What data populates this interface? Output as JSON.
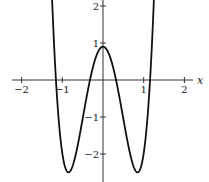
{
  "chart_data": {
    "type": "line",
    "title": "",
    "xlabel": "x",
    "ylabel": "",
    "xlim": [
      -2.3,
      2.3
    ],
    "ylim": [
      -2.75,
      2.2
    ],
    "grid": false,
    "legend": null,
    "x_ticks": [
      -2,
      -1,
      1,
      2
    ],
    "x_tick_labels": [
      "−2",
      "−1",
      "1",
      "2"
    ],
    "y_ticks": [
      2,
      1,
      -1,
      -2
    ],
    "y_tick_labels": [
      "2",
      "1",
      "−1",
      "−2"
    ],
    "series": [
      {
        "name": "f(x)",
        "formula": "6.56x^4 - 9.44x^2 + 0.9",
        "x": [
          -1.26,
          -1.2,
          -1.15,
          -1.1,
          -1.0,
          -0.85,
          -0.7,
          -0.5,
          -0.32,
          -0.2,
          0,
          0.2,
          0.32,
          0.5,
          0.7,
          0.85,
          1.0,
          1.1,
          1.15,
          1.2,
          1.26
        ],
        "y": [
          2.2,
          1.2,
          0.0,
          -0.9,
          -1.98,
          -2.5,
          -2.1,
          -1.05,
          0.0,
          0.53,
          0.9,
          0.53,
          0.0,
          -1.05,
          -2.1,
          -2.5,
          -1.98,
          -0.9,
          0.0,
          1.2,
          2.2
        ]
      }
    ],
    "annotations": [
      {
        "type": "local_max",
        "x": 0,
        "y": 0.9
      },
      {
        "type": "local_min",
        "x": -0.85,
        "y": -2.5
      },
      {
        "type": "local_min",
        "x": 0.85,
        "y": -2.5
      }
    ]
  },
  "plot": {
    "coeffs": {
      "a": 6.56,
      "b": -9.44,
      "c": 0.9
    },
    "origin_px": [
      103,
      80
    ],
    "x_scale_px": 40.7,
    "y_scale_px": 37.0,
    "line_color": "#111111",
    "axis_color": "#333333"
  }
}
